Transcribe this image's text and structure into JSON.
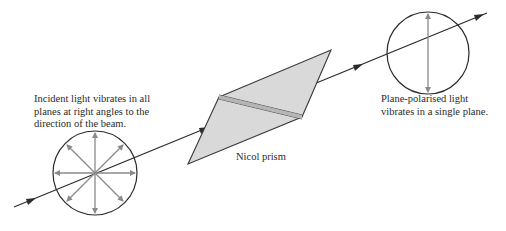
{
  "diagram": {
    "labels": {
      "incident": "Incident light vibrates in all\nplanes at right angles to the\ndirection of the beam.",
      "prism": "Nicol prism",
      "polarised": "Plane-polarised light\nvibrates in a single plane."
    },
    "colors": {
      "line": "#2b2b2b",
      "vibration_arrow": "#8a8a8a",
      "prism_fill": "#d9d9d9",
      "prism_stroke": "#3a3a3a"
    }
  }
}
